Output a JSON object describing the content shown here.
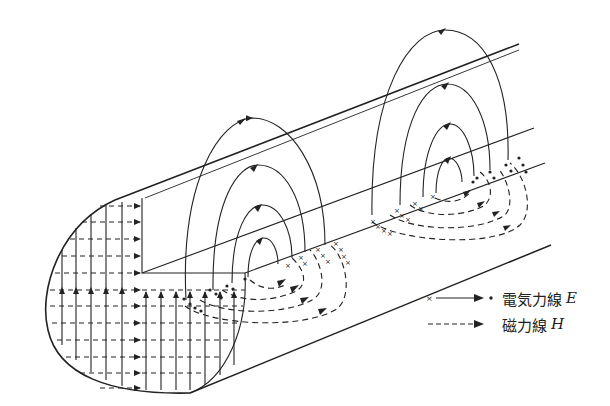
{
  "diagram": {
    "colors": {
      "line": "#222222",
      "background": "#ffffff"
    }
  },
  "legend": {
    "electric": {
      "label": "電気力線",
      "symbol": "E",
      "style": "solid line with arrow, × start, • end"
    },
    "magnetic": {
      "label": "磁力線",
      "symbol": "H",
      "style": "dashed line with arrow"
    }
  }
}
